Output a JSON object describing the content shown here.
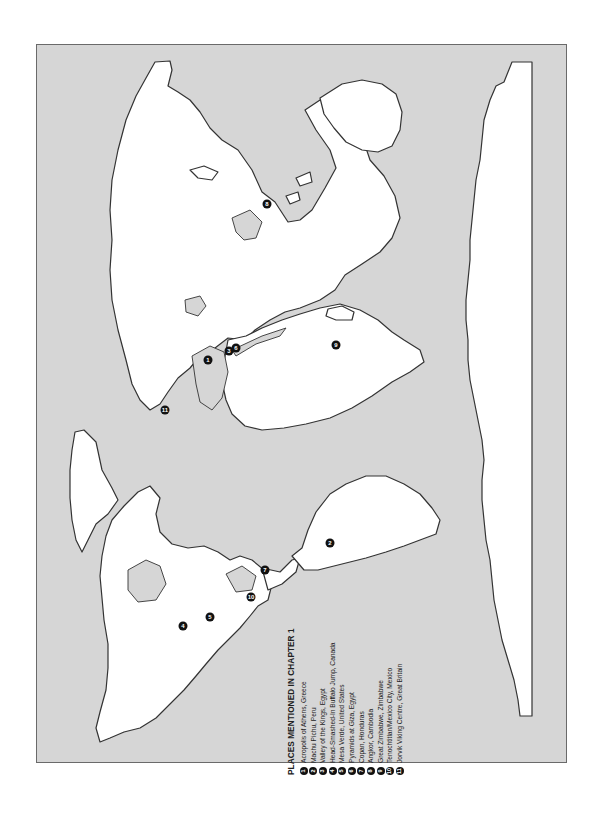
{
  "legend": {
    "title": "PLACES MENTIONED IN CHAPTER 1",
    "items": [
      {
        "num": "1",
        "label": "Acropolis of Athens, Greece"
      },
      {
        "num": "2",
        "label": "Machu Pichu, Peru"
      },
      {
        "num": "3",
        "label": "Valley of the Kings, Egypt"
      },
      {
        "num": "4",
        "label": "Head-Smashed-In Buffalo Jump, Canada"
      },
      {
        "num": "5",
        "label": "Mesa Verde, United States"
      },
      {
        "num": "6",
        "label": "Pyramids at Giza, Egypt"
      },
      {
        "num": "7",
        "label": "Copan, Honduras"
      },
      {
        "num": "8",
        "label": "Angkor, Cambodia"
      },
      {
        "num": "9",
        "label": "Great Zimbabwe, Zimbabwe"
      },
      {
        "num": "10",
        "label": "Tenochtitlan/Mexico City, Mexico"
      },
      {
        "num": "11",
        "label": "Jorvik Viking Centre, Great Britain"
      }
    ]
  },
  "map": {
    "orientation": "rotated 90° (north to the left)",
    "ocean_color": "#d6d6d6",
    "land_color": "#ffffff",
    "markers": [
      {
        "num": "1",
        "x": 208,
        "y": 360
      },
      {
        "num": "2",
        "x": 330,
        "y": 543
      },
      {
        "num": "3",
        "x": 229,
        "y": 351
      },
      {
        "num": "6",
        "x": 235,
        "y": 348
      },
      {
        "num": "4",
        "x": 183,
        "y": 626
      },
      {
        "num": "5",
        "x": 210,
        "y": 617
      },
      {
        "num": "7",
        "x": 265,
        "y": 570
      },
      {
        "num": "8",
        "x": 267,
        "y": 204
      },
      {
        "num": "9",
        "x": 336,
        "y": 345
      },
      {
        "num": "10",
        "x": 251,
        "y": 597
      },
      {
        "num": "11",
        "x": 165,
        "y": 410
      }
    ]
  }
}
